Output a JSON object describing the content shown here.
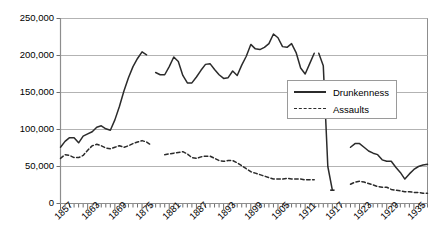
{
  "chart_data": {
    "type": "line",
    "title": "",
    "subtitle": "",
    "xlabel": "",
    "ylabel": "",
    "grid": true,
    "legend_position": "inside-right",
    "xlim": [
      1857,
      1938
    ],
    "ylim": [
      0,
      250000
    ],
    "ytick_labels": [
      "250,000",
      "200,000",
      "150,000",
      "100,000",
      "50,000",
      "0"
    ],
    "ytick_values": [
      250000,
      200000,
      150000,
      100000,
      50000,
      0
    ],
    "xtick_labels": [
      "1857",
      "1863",
      "1869",
      "1875",
      "1881",
      "1887",
      "1893",
      "1899",
      "1905",
      "1911",
      "1917",
      "1923",
      "1929",
      "1935"
    ],
    "xtick_values": [
      1857,
      1863,
      1869,
      1875,
      1881,
      1887,
      1893,
      1899,
      1905,
      1911,
      1917,
      1923,
      1929,
      1935
    ],
    "series": [
      {
        "name": "Drunkenness",
        "style": "solid",
        "color": "#2b2b2b",
        "segments": [
          {
            "x": [
              1857,
              1858,
              1859,
              1860,
              1861,
              1862,
              1863,
              1864,
              1865,
              1866,
              1867,
              1868,
              1869,
              1870,
              1871,
              1872,
              1873,
              1874,
              1875,
              1876
            ],
            "y": [
              76000,
              84000,
              89000,
              89000,
              82000,
              91000,
              94000,
              97000,
              103000,
              105000,
              101000,
              99000,
              113000,
              131000,
              152000,
              170000,
              185000,
              196000,
              205000,
              201000
            ]
          },
          {
            "x": [
              1878,
              1879,
              1880,
              1881,
              1882,
              1883,
              1884,
              1885,
              1886,
              1887,
              1888,
              1889,
              1890,
              1891,
              1892,
              1893,
              1894,
              1895,
              1896,
              1897,
              1898,
              1899,
              1900,
              1901,
              1902,
              1903,
              1904,
              1905,
              1906,
              1907,
              1908,
              1909,
              1910,
              1911,
              1912,
              1913
            ],
            "y": [
              177000,
              174000,
              174000,
              185000,
              198000,
              192000,
              173000,
              163000,
              163000,
              171000,
              180000,
              188000,
              189000,
              181000,
              174000,
              169000,
              170000,
              179000,
              173000,
              187000,
              199000,
              215000,
              209000,
              208000,
              211000,
              216000,
              229000,
              224000,
              212000,
              211000,
              216000,
              204000,
              183000,
              175000,
              189000,
              203000
            ]
          },
          {
            "x": [
              1914,
              1915,
              1916,
              1917
            ],
            "y": [
              203000,
              186000,
              50000,
              18000
            ]
          },
          {
            "x": [
              1921,
              1922,
              1923,
              1924,
              1925,
              1926,
              1927,
              1928,
              1929,
              1930,
              1931,
              1932,
              1933,
              1934,
              1935,
              1936,
              1937,
              1938
            ],
            "y": [
              76000,
              81000,
              81000,
              76000,
              71000,
              68000,
              66000,
              59000,
              57000,
              57000,
              49000,
              42000,
              33000,
              40000,
              46000,
              50000,
              52000,
              53000
            ]
          }
        ]
      },
      {
        "name": "Assaults",
        "style": "dashed",
        "color": "#2b2b2b",
        "segments": [
          {
            "x": [
              1857,
              1858,
              1859,
              1860,
              1861,
              1862,
              1863,
              1864,
              1865,
              1866,
              1867,
              1868,
              1869,
              1870,
              1871,
              1872,
              1873,
              1874,
              1875,
              1876,
              1877
            ],
            "y": [
              61000,
              66000,
              65000,
              62000,
              62000,
              65000,
              72000,
              78000,
              80000,
              78000,
              75000,
              74000,
              76000,
              78000,
              76000,
              78000,
              81000,
              83000,
              85000,
              83000,
              79000
            ]
          },
          {
            "x": [
              1880,
              1881,
              1882,
              1883,
              1884,
              1885,
              1886,
              1887,
              1888,
              1889,
              1890,
              1891,
              1892,
              1893,
              1894,
              1895,
              1896,
              1897,
              1898,
              1899,
              1900,
              1901,
              1902,
              1903,
              1904,
              1905,
              1906,
              1907,
              1908,
              1909,
              1910,
              1911,
              1912,
              1913
            ],
            "y": [
              66000,
              67000,
              68000,
              69000,
              70000,
              67000,
              62000,
              61000,
              63000,
              64000,
              64000,
              61000,
              58000,
              57000,
              58000,
              58000,
              55000,
              51000,
              47000,
              43000,
              41000,
              39000,
              37000,
              35000,
              33000,
              33000,
              33000,
              34000,
              33000,
              33000,
              33000,
              32000,
              32000,
              32000
            ]
          },
          {
            "x": [
              1917
            ],
            "y": [
              18000
            ]
          },
          {
            "x": [
              1921,
              1922,
              1923,
              1924,
              1925,
              1926,
              1927,
              1928,
              1929,
              1930,
              1931,
              1932,
              1933,
              1934,
              1935,
              1936,
              1937,
              1938
            ],
            "y": [
              26000,
              29000,
              30000,
              29000,
              27000,
              25000,
              23000,
              22000,
              22000,
              19000,
              18000,
              17000,
              16000,
              16000,
              15000,
              15000,
              14000,
              14000
            ]
          }
        ]
      }
    ]
  },
  "legend": {
    "items": [
      {
        "label": "Drunkenness",
        "key": "solid-line-key"
      },
      {
        "label": "Assaults",
        "key": "dashed-line-key"
      }
    ]
  }
}
